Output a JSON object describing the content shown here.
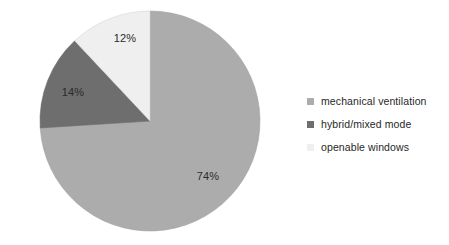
{
  "chart_data": {
    "type": "pie",
    "title": "",
    "subtitle": "",
    "xlabel": "",
    "ylabel": "",
    "grid": false,
    "legend_position": "right",
    "start_angle_deg": 90,
    "direction": "clockwise",
    "categories": [
      "mechanical ventilation",
      "hybrid/mixed mode",
      "openable windows"
    ],
    "values": [
      74,
      14,
      12
    ],
    "value_unit": "%",
    "data_labels": [
      "74%",
      "14%",
      "12%"
    ],
    "colors": [
      "#ACACAC",
      "#6E6E6E",
      "#EFEFEF"
    ],
    "slices": [
      {
        "name": "mechanical ventilation",
        "value": 74,
        "label": "74%",
        "color": "#ACACAC"
      },
      {
        "name": "hybrid/mixed mode",
        "value": 14,
        "label": "14%",
        "color": "#6E6E6E"
      },
      {
        "name": "openable windows",
        "value": 12,
        "label": "12%",
        "color": "#EFEFEF"
      }
    ]
  },
  "figure": {
    "background_color": "#FFFFFF",
    "label_text_color": "#2B2B2B",
    "legend_text_color": "#272727",
    "slice_edge_color": "#9A9A9A"
  },
  "legend": {
    "items": [
      {
        "label": "mechanical ventilation",
        "color": "#ACACAC",
        "marker": "square-swatch"
      },
      {
        "label": "hybrid/mixed mode",
        "color": "#6E6E6E",
        "marker": "square-swatch"
      },
      {
        "label": "openable windows",
        "color": "#EFEFEF",
        "marker": "square-swatch"
      }
    ]
  },
  "labels": {
    "mechanical": "74%",
    "hybrid": "14%",
    "openable": "12%"
  }
}
